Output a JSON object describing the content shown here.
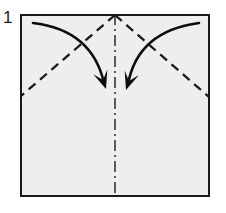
{
  "diagram": {
    "step_number": "1",
    "type": "origami-instruction",
    "canvas": {
      "width": 226,
      "height": 213
    },
    "paper": {
      "name": "square-paper-sheet",
      "shape": "square",
      "x": 20,
      "y": 14,
      "width": 190,
      "height": 183,
      "fill_color": "#eeeeee",
      "stroke_color": "#1a1a1a",
      "stroke_width": 2.2
    },
    "creases": [
      {
        "name": "center-vertical-crease",
        "style": "dash-dot",
        "meaning": "existing crease / mountain-valley reference line",
        "color": "#2b2b2b",
        "x1": 115,
        "y1": 14,
        "x2": 115,
        "y2": 197
      },
      {
        "name": "left-diagonal-fold-line",
        "style": "dashed",
        "meaning": "valley fold",
        "color": "#1a1a1a",
        "x1": 115,
        "y1": 15,
        "x2": 21,
        "y2": 96
      },
      {
        "name": "right-diagonal-fold-line",
        "style": "dashed",
        "meaning": "valley fold",
        "color": "#1a1a1a",
        "x1": 115,
        "y1": 15,
        "x2": 209,
        "y2": 97
      }
    ],
    "arrows": [
      {
        "name": "left-fold-arrow",
        "direction": "down-right",
        "meaning": "fold top-left corner down to center",
        "color": "#0d0d0d",
        "start": {
          "x": 33,
          "y": 23
        },
        "control": {
          "x": 92,
          "y": 30
        },
        "end": {
          "x": 104,
          "y": 83
        },
        "tip": {
          "x": 106,
          "y": 89
        }
      },
      {
        "name": "right-fold-arrow",
        "direction": "down-left",
        "meaning": "fold top-right corner down to center",
        "color": "#0d0d0d",
        "start": {
          "x": 199,
          "y": 23
        },
        "control": {
          "x": 138,
          "y": 31
        },
        "end": {
          "x": 128,
          "y": 84
        },
        "tip": {
          "x": 126,
          "y": 90
        }
      }
    ],
    "colors": {
      "background": "#ffffff",
      "paper_fill": "#eeeeee",
      "ink": "#1a1a1a",
      "crease": "#2b2b2b"
    }
  }
}
